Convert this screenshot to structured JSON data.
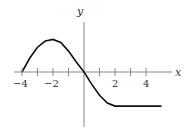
{
  "chart_data": {
    "type": "line",
    "title": "",
    "xlabel": "x",
    "ylabel": "y",
    "xticks": [
      -4,
      -3,
      -2,
      -1,
      1,
      2,
      3,
      4
    ],
    "xtick_labels": [
      "-4",
      "-2",
      "2",
      "4"
    ],
    "xlim": [
      -4.2,
      5.5
    ],
    "ylim": [
      -3.5,
      3.2
    ],
    "grid": false,
    "series": [
      {
        "name": "f(x)",
        "x": [
          -4,
          -3.5,
          -3,
          -2.5,
          -2,
          -1.5,
          -1,
          -0.5,
          0,
          0.5,
          1,
          1.5,
          2,
          3,
          4,
          5
        ],
        "y": [
          0,
          0.9,
          1.6,
          2.0,
          2.1,
          1.9,
          1.35,
          0.65,
          0,
          -0.8,
          -1.5,
          -2.0,
          -2.2,
          -2.2,
          -2.2,
          -2.2
        ]
      }
    ]
  }
}
